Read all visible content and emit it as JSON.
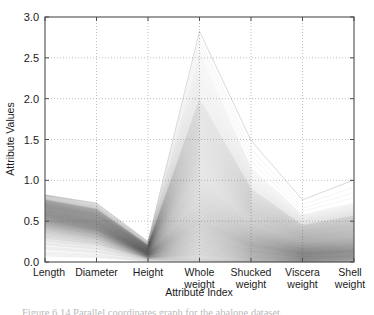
{
  "figure": {
    "background_color": "#ffffff",
    "axes_color": "#4d4d4d",
    "grid_color": "#b0b0b0",
    "line_color": "#555555",
    "caption_partial": "Figure 6.14  Parallel coordinates graph for the abalone dataset."
  },
  "chart_data": {
    "type": "line",
    "subtype": "parallel-coordinates",
    "title": "",
    "xlabel": "Attribute Index",
    "ylabel": "Attribute Values",
    "categories": [
      "Length",
      "Diameter",
      "Height",
      "Whole weight",
      "Shucked weight",
      "Viscera weight",
      "Shell weight"
    ],
    "category_lines": [
      [
        "Length"
      ],
      [
        "Diameter"
      ],
      [
        "Height"
      ],
      [
        "Whole",
        "weight"
      ],
      [
        "Shucked",
        "weight"
      ],
      [
        "Viscera",
        "weight"
      ],
      [
        "Shell",
        "weight"
      ]
    ],
    "ylim": [
      0.0,
      3.0
    ],
    "yticks": [
      0.0,
      0.5,
      1.0,
      1.5,
      2.0,
      2.5,
      3.0
    ],
    "ytick_labels": [
      "0.0",
      "0.5",
      "1.0",
      "1.5",
      "2.0",
      "2.5",
      "3.0"
    ],
    "grid": true,
    "grid_style": "dotted",
    "legend": "none",
    "n_series": 260,
    "axis_ranges": [
      {
        "attribute": "Length",
        "min": 0.07,
        "max": 0.82
      },
      {
        "attribute": "Diameter",
        "min": 0.05,
        "max": 0.66
      },
      {
        "attribute": "Height",
        "min": 0.0,
        "max": 0.25
      },
      {
        "attribute": "Whole weight",
        "min": 0.01,
        "max": 2.83
      },
      {
        "attribute": "Shucked weight",
        "min": 0.0,
        "max": 1.49
      },
      {
        "attribute": "Viscera weight",
        "min": 0.0,
        "max": 0.76
      },
      {
        "attribute": "Shell weight",
        "min": 0.0,
        "max": 1.01
      }
    ],
    "series": [
      {
        "name": "q00",
        "values": [
          0.075,
          0.055,
          0.01,
          0.002,
          0.001,
          0.0,
          0.002
        ]
      },
      {
        "name": "q01",
        "values": [
          0.15,
          0.11,
          0.03,
          0.02,
          0.008,
          0.004,
          0.006
        ]
      },
      {
        "name": "q02",
        "values": [
          0.205,
          0.155,
          0.04,
          0.04,
          0.016,
          0.008,
          0.012
        ]
      },
      {
        "name": "q03",
        "values": [
          0.25,
          0.19,
          0.047,
          0.062,
          0.026,
          0.013,
          0.02
        ]
      },
      {
        "name": "q04",
        "values": [
          0.285,
          0.218,
          0.053,
          0.085,
          0.036,
          0.018,
          0.027
        ]
      },
      {
        "name": "q05",
        "values": [
          0.315,
          0.24,
          0.058,
          0.11,
          0.047,
          0.023,
          0.034
        ]
      },
      {
        "name": "q06",
        "values": [
          0.34,
          0.26,
          0.062,
          0.135,
          0.058,
          0.029,
          0.041
        ]
      },
      {
        "name": "q07",
        "values": [
          0.362,
          0.278,
          0.066,
          0.16,
          0.069,
          0.034,
          0.048
        ]
      },
      {
        "name": "q08",
        "values": [
          0.382,
          0.294,
          0.07,
          0.186,
          0.08,
          0.04,
          0.055
        ]
      },
      {
        "name": "q09",
        "values": [
          0.4,
          0.308,
          0.074,
          0.212,
          0.092,
          0.046,
          0.062
        ]
      },
      {
        "name": "q10",
        "values": [
          0.416,
          0.321,
          0.078,
          0.238,
          0.104,
          0.052,
          0.069
        ]
      },
      {
        "name": "q11",
        "values": [
          0.431,
          0.334,
          0.081,
          0.265,
          0.116,
          0.058,
          0.076
        ]
      },
      {
        "name": "q12",
        "values": [
          0.445,
          0.345,
          0.084,
          0.292,
          0.128,
          0.064,
          0.083
        ]
      },
      {
        "name": "q13",
        "values": [
          0.458,
          0.356,
          0.087,
          0.32,
          0.14,
          0.07,
          0.091
        ]
      },
      {
        "name": "q14",
        "values": [
          0.47,
          0.366,
          0.09,
          0.348,
          0.152,
          0.077,
          0.099
        ]
      },
      {
        "name": "q15",
        "values": [
          0.481,
          0.376,
          0.093,
          0.376,
          0.165,
          0.083,
          0.107
        ]
      },
      {
        "name": "q16",
        "values": [
          0.492,
          0.385,
          0.096,
          0.404,
          0.178,
          0.09,
          0.115
        ]
      },
      {
        "name": "q17",
        "values": [
          0.502,
          0.394,
          0.099,
          0.433,
          0.191,
          0.096,
          0.123
        ]
      },
      {
        "name": "q18",
        "values": [
          0.512,
          0.402,
          0.102,
          0.462,
          0.204,
          0.103,
          0.131
        ]
      },
      {
        "name": "q19",
        "values": [
          0.521,
          0.41,
          0.104,
          0.491,
          0.217,
          0.11,
          0.139
        ]
      },
      {
        "name": "q20",
        "values": [
          0.53,
          0.418,
          0.107,
          0.52,
          0.23,
          0.116,
          0.147
        ]
      },
      {
        "name": "q21",
        "values": [
          0.539,
          0.426,
          0.11,
          0.55,
          0.244,
          0.123,
          0.156
        ]
      },
      {
        "name": "q22",
        "values": [
          0.547,
          0.433,
          0.112,
          0.58,
          0.257,
          0.13,
          0.164
        ]
      },
      {
        "name": "q23",
        "values": [
          0.555,
          0.44,
          0.115,
          0.61,
          0.271,
          0.137,
          0.173
        ]
      },
      {
        "name": "q24",
        "values": [
          0.562,
          0.447,
          0.117,
          0.64,
          0.285,
          0.144,
          0.182
        ]
      },
      {
        "name": "q25",
        "values": [
          0.57,
          0.454,
          0.12,
          0.671,
          0.299,
          0.151,
          0.191
        ]
      },
      {
        "name": "q26",
        "values": [
          0.577,
          0.461,
          0.122,
          0.702,
          0.313,
          0.158,
          0.2
        ]
      },
      {
        "name": "q27",
        "values": [
          0.584,
          0.467,
          0.125,
          0.733,
          0.327,
          0.165,
          0.209
        ]
      },
      {
        "name": "q28",
        "values": [
          0.59,
          0.474,
          0.127,
          0.765,
          0.342,
          0.172,
          0.218
        ]
      },
      {
        "name": "q29",
        "values": [
          0.597,
          0.48,
          0.13,
          0.797,
          0.356,
          0.18,
          0.228
        ]
      },
      {
        "name": "q30",
        "values": [
          0.603,
          0.486,
          0.132,
          0.829,
          0.371,
          0.187,
          0.237
        ]
      },
      {
        "name": "q31",
        "values": [
          0.61,
          0.492,
          0.134,
          0.862,
          0.386,
          0.195,
          0.247
        ]
      },
      {
        "name": "q32",
        "values": [
          0.616,
          0.498,
          0.137,
          0.895,
          0.401,
          0.202,
          0.257
        ]
      },
      {
        "name": "q33",
        "values": [
          0.622,
          0.504,
          0.139,
          0.929,
          0.417,
          0.21,
          0.267
        ]
      },
      {
        "name": "q34",
        "values": [
          0.628,
          0.51,
          0.142,
          0.963,
          0.432,
          0.218,
          0.277
        ]
      },
      {
        "name": "q35",
        "values": [
          0.634,
          0.515,
          0.144,
          0.997,
          0.448,
          0.226,
          0.287
        ]
      },
      {
        "name": "q36",
        "values": [
          0.639,
          0.521,
          0.146,
          1.032,
          0.464,
          0.234,
          0.297
        ]
      },
      {
        "name": "q37",
        "values": [
          0.645,
          0.527,
          0.149,
          1.068,
          0.48,
          0.242,
          0.308
        ]
      },
      {
        "name": "q38",
        "values": [
          0.651,
          0.532,
          0.151,
          1.104,
          0.497,
          0.25,
          0.318
        ]
      },
      {
        "name": "q39",
        "values": [
          0.656,
          0.538,
          0.153,
          1.141,
          0.513,
          0.259,
          0.329
        ]
      },
      {
        "name": "q40",
        "values": [
          0.662,
          0.543,
          0.156,
          1.178,
          0.53,
          0.267,
          0.34
        ]
      },
      {
        "name": "q41",
        "values": [
          0.667,
          0.549,
          0.158,
          1.216,
          0.547,
          0.276,
          0.351
        ]
      },
      {
        "name": "q42",
        "values": [
          0.673,
          0.554,
          0.161,
          1.255,
          0.565,
          0.285,
          0.362
        ]
      },
      {
        "name": "q43",
        "values": [
          0.678,
          0.56,
          0.163,
          1.295,
          0.583,
          0.294,
          0.374
        ]
      },
      {
        "name": "q44",
        "values": [
          0.684,
          0.566,
          0.166,
          1.335,
          0.601,
          0.303,
          0.385
        ]
      },
      {
        "name": "q45",
        "values": [
          0.689,
          0.571,
          0.168,
          1.377,
          0.62,
          0.312,
          0.397
        ]
      },
      {
        "name": "q46",
        "values": [
          0.695,
          0.577,
          0.171,
          1.419,
          0.639,
          0.322,
          0.409
        ]
      },
      {
        "name": "q47",
        "values": [
          0.7,
          0.583,
          0.174,
          1.463,
          0.658,
          0.332,
          0.422
        ]
      },
      {
        "name": "q48",
        "values": [
          0.706,
          0.588,
          0.176,
          1.508,
          0.678,
          0.342,
          0.435
        ]
      },
      {
        "name": "q49",
        "values": [
          0.712,
          0.594,
          0.179,
          1.554,
          0.699,
          0.352,
          0.448
        ]
      },
      {
        "name": "q50",
        "values": [
          0.718,
          0.6,
          0.182,
          1.602,
          0.72,
          0.363,
          0.461
        ]
      },
      {
        "name": "q51",
        "values": [
          0.724,
          0.607,
          0.185,
          1.652,
          0.742,
          0.374,
          0.475
        ]
      },
      {
        "name": "q52",
        "values": [
          0.73,
          0.613,
          0.188,
          1.703,
          0.765,
          0.385,
          0.489
        ]
      },
      {
        "name": "q53",
        "values": [
          0.736,
          0.62,
          0.191,
          1.757,
          0.789,
          0.397,
          0.504
        ]
      },
      {
        "name": "q54",
        "values": [
          0.743,
          0.627,
          0.195,
          1.813,
          0.814,
          0.41,
          0.519
        ]
      },
      {
        "name": "q55",
        "values": [
          0.75,
          0.634,
          0.198,
          1.872,
          0.84,
          0.423,
          0.535
        ]
      },
      {
        "name": "q56",
        "values": [
          0.757,
          0.641,
          0.202,
          1.934,
          0.868,
          0.436,
          0.552
        ]
      },
      {
        "name": "q57",
        "values": [
          0.765,
          0.649,
          0.206,
          2.0,
          0.898,
          0.451,
          0.57
        ]
      },
      {
        "name": "q58",
        "values": [
          0.773,
          0.657,
          0.211,
          2.071,
          0.93,
          0.467,
          0.589
        ]
      },
      {
        "name": "q59",
        "values": [
          0.781,
          0.666,
          0.215,
          2.148,
          0.964,
          0.484,
          0.609
        ]
      },
      {
        "name": "q60",
        "values": [
          0.79,
          0.675,
          0.221,
          2.233,
          1.002,
          0.502,
          0.631
        ]
      },
      {
        "name": "q61",
        "values": [
          0.799,
          0.685,
          0.227,
          2.33,
          1.045,
          0.523,
          0.656
        ]
      },
      {
        "name": "q62",
        "values": [
          0.808,
          0.696,
          0.234,
          2.443,
          1.096,
          0.548,
          0.686
        ]
      },
      {
        "name": "q63",
        "values": [
          0.816,
          0.708,
          0.242,
          2.585,
          1.158,
          0.58,
          0.724
        ]
      },
      {
        "name": "q64",
        "values": [
          0.82,
          0.722,
          0.251,
          2.826,
          1.488,
          0.76,
          1.005
        ]
      }
    ]
  }
}
